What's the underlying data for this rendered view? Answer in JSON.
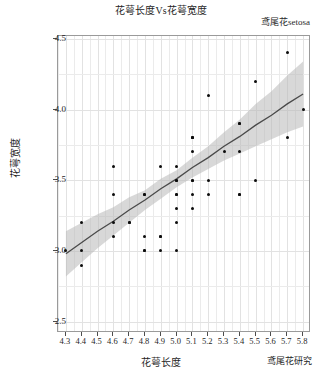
{
  "chart_data": {
    "type": "scatter",
    "title": "花萼长度Vs花萼宽度",
    "subtitle": "鸢尾花setosa",
    "xlabel": "花萼长度",
    "ylabel": "花萼宽度",
    "caption": "鸢尾花研究",
    "xlim": [
      4.25,
      5.85
    ],
    "ylim": [
      2.42,
      4.52
    ],
    "xticks": [
      "4.3",
      "4.4",
      "4.5",
      "4.6",
      "4.7",
      "4.8",
      "4.9",
      "5.0",
      "5.1",
      "5.2",
      "5.3",
      "5.4",
      "5.5",
      "5.6",
      "5.7",
      "5.8"
    ],
    "xtick_values": [
      4.3,
      4.4,
      4.5,
      4.6,
      4.7,
      4.8,
      4.9,
      5.0,
      5.1,
      5.2,
      5.3,
      5.4,
      5.5,
      5.6,
      5.7,
      5.8
    ],
    "yticks": [
      "2.5",
      "3.0",
      "3.5",
      "4.0",
      "4.5"
    ],
    "ytick_values": [
      2.5,
      3.0,
      3.5,
      4.0,
      4.5
    ],
    "grid": true,
    "legend": "none",
    "point_color": "#0d0d0d",
    "line_color": "#4a4a4a",
    "ribbon_color": "#b8b8b8",
    "panel_bg": "#ffffff",
    "grid_color": "#ebebeb",
    "series": [
      {
        "name": "setosa",
        "x": [
          5.1,
          4.9,
          4.7,
          4.6,
          5.0,
          5.4,
          4.6,
          5.0,
          4.4,
          4.9,
          5.4,
          4.8,
          4.8,
          4.3,
          5.8,
          5.7,
          5.4,
          5.1,
          5.7,
          5.1,
          5.4,
          5.1,
          4.6,
          5.1,
          4.8,
          5.0,
          5.0,
          5.2,
          5.2,
          4.7,
          4.8,
          5.4,
          5.2,
          5.5,
          4.9,
          5.0,
          5.5,
          4.9,
          4.4,
          5.1,
          5.0,
          4.5,
          4.4,
          5.0,
          5.1,
          4.8,
          5.1,
          4.6,
          5.3,
          5.0
        ],
        "y": [
          3.5,
          3.0,
          3.2,
          3.1,
          3.6,
          3.9,
          3.4,
          3.4,
          2.9,
          3.1,
          3.7,
          3.4,
          3.0,
          3.0,
          4.0,
          4.4,
          3.9,
          3.5,
          3.8,
          3.8,
          3.4,
          3.7,
          3.6,
          3.3,
          3.4,
          3.0,
          3.4,
          3.5,
          3.4,
          3.2,
          3.1,
          3.4,
          4.1,
          4.2,
          3.1,
          3.2,
          3.5,
          3.6,
          3.0,
          3.4,
          3.5,
          2.3,
          3.2,
          3.5,
          3.8,
          3.0,
          3.8,
          3.2,
          3.7,
          3.3
        ]
      }
    ],
    "fit": {
      "type": "linear",
      "method": "lm",
      "se": true,
      "x": [
        4.3,
        4.4,
        4.5,
        4.6,
        4.7,
        4.8,
        4.9,
        5.0,
        5.1,
        5.2,
        5.3,
        5.4,
        5.5,
        5.6,
        5.7,
        5.8
      ],
      "y": [
        2.98,
        3.06,
        3.14,
        3.21,
        3.29,
        3.36,
        3.44,
        3.51,
        3.59,
        3.66,
        3.74,
        3.81,
        3.89,
        3.96,
        4.04,
        4.11
      ],
      "ymin": [
        2.82,
        2.92,
        3.02,
        3.11,
        3.2,
        3.29,
        3.37,
        3.45,
        3.52,
        3.58,
        3.64,
        3.69,
        3.74,
        3.79,
        3.84,
        3.88
      ],
      "ymax": [
        3.14,
        3.2,
        3.26,
        3.31,
        3.38,
        3.43,
        3.51,
        3.57,
        3.66,
        3.74,
        3.84,
        3.93,
        4.04,
        4.13,
        4.24,
        4.34
      ]
    }
  }
}
